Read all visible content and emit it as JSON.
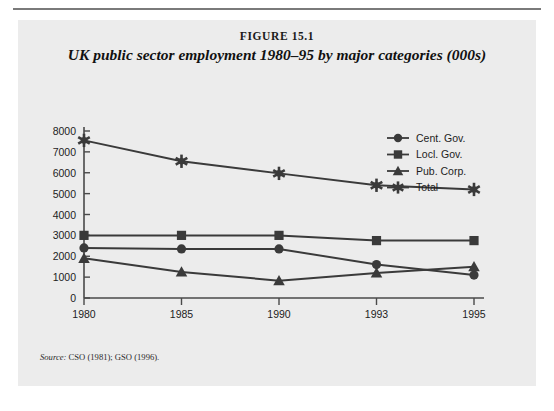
{
  "figure": {
    "number_label": "FIGURE 15.1",
    "title": "UK public sector employment 1980–95 by major categories (000s)",
    "source_label": "Source:",
    "source_text": " CSO (1981); GSO (1996)."
  },
  "colors": {
    "panel_background": "#ececec",
    "page_background": "#ffffff",
    "ink": "#3a3a3a",
    "axis": "#4a4a4a",
    "rule": "#7a7a7a"
  },
  "chart_data": {
    "type": "line",
    "title": "UK public sector employment 1980–95 by major categories (000s)",
    "xlabel": "",
    "ylabel": "",
    "categories": [
      "1980",
      "1985",
      "1990",
      "1993",
      "1995"
    ],
    "ylim": [
      0,
      8000
    ],
    "ytick_labels": [
      "0",
      "1000",
      "2000",
      "3000",
      "4000",
      "5000",
      "6000",
      "7000",
      "8000"
    ],
    "yticks": [
      0,
      1000,
      2000,
      3000,
      4000,
      5000,
      6000,
      7000,
      8000
    ],
    "grid": false,
    "legend_position": "top-right",
    "series": [
      {
        "name": "Cent. Gov.",
        "marker": "circle",
        "values": [
          2400,
          2350,
          2350,
          1600,
          1100
        ]
      },
      {
        "name": "Locl. Gov.",
        "marker": "square",
        "values": [
          3000,
          3000,
          3000,
          2750,
          2750
        ]
      },
      {
        "name": "Pub. Corp.",
        "marker": "triangle",
        "values": [
          1900,
          1250,
          830,
          1200,
          1500
        ]
      },
      {
        "name": "Total",
        "marker": "star",
        "values": [
          7550,
          6550,
          5970,
          5400,
          5200
        ]
      }
    ]
  }
}
